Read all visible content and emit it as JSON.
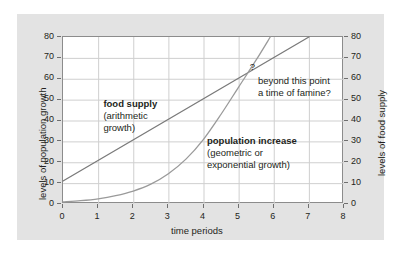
{
  "chart_data": {
    "type": "line",
    "title": "",
    "xlabel": "time periods",
    "ylabel": "levels of population growth",
    "y2label": "levels of food supply",
    "xlim": [
      0,
      8
    ],
    "ylim": [
      0,
      80
    ],
    "y2lim": [
      0,
      80
    ],
    "grid": true,
    "legend_position": "inline-annotations",
    "x_ticks": [
      "0",
      "1",
      "2",
      "3",
      "4",
      "5",
      "6",
      "7",
      "8"
    ],
    "y_ticks": [
      "0",
      "10",
      "20",
      "30",
      "40",
      "50",
      "60",
      "70",
      "80"
    ],
    "y2_ticks": [
      "0",
      "10",
      "20",
      "30",
      "40",
      "50",
      "60",
      "70",
      "80"
    ],
    "x": [
      0,
      0.5,
      1,
      1.5,
      2,
      2.5,
      3,
      3.5,
      4,
      4.5,
      5,
      5.5,
      6,
      6.5,
      7
    ],
    "series": [
      {
        "name": "food supply",
        "description": "arithmetic growth",
        "axis": "right",
        "color": "#7a7a7a",
        "x": [
          0,
          7
        ],
        "values": [
          11,
          80
        ]
      },
      {
        "name": "population increase",
        "description": "geometric or exponential growth",
        "axis": "left",
        "color": "#9a9a9a",
        "x": [
          0,
          0.5,
          1,
          1.5,
          2,
          2.5,
          3,
          3.5,
          4,
          4.5,
          5,
          5.5,
          5.9
        ],
        "values": [
          1,
          1.6,
          2.5,
          4,
          6.2,
          9.5,
          14.5,
          21.5,
          31,
          43,
          56,
          69,
          80
        ]
      }
    ],
    "annotations": [
      {
        "name": "food-supply-label",
        "header": "food supply",
        "lines": [
          "(arithmetic",
          "growth)"
        ],
        "x": 1.15,
        "y": 51
      },
      {
        "name": "population-increase-label",
        "header": "population increase",
        "lines": [
          "(geometric or",
          "exponential growth)"
        ],
        "x": 4.1,
        "y": 33
      },
      {
        "name": "famine-note",
        "header": "",
        "lines": [
          "beyond this point",
          "a time of famine?"
        ],
        "x": 5.55,
        "y": 62
      },
      {
        "name": "question-mark-marker",
        "header": "?",
        "lines": [],
        "x": 5.32,
        "y": 68
      }
    ],
    "crossing_point": {
      "x": 5.4,
      "y": 65
    }
  },
  "axes": {
    "left_title": "levels of population growth",
    "right_title": "levels of food supply",
    "x_title": "time periods"
  },
  "labels": {
    "food_supply_header": "food supply",
    "food_supply_line1": "(arithmetic",
    "food_supply_line2": "growth)",
    "population_header": "population increase",
    "population_line1": "(geometric or",
    "population_line2": "exponential growth)",
    "famine_line1": "beyond this point",
    "famine_line2": "a time of famine?",
    "question_mark": "?"
  },
  "colors": {
    "panel_background": "#e3e3e3",
    "plot_background": "#ffffff",
    "grid": "#cfcfcf",
    "frame": "#8c8c8c",
    "food_supply_line": "#7a7a7a",
    "population_line": "#9a9a9a",
    "text": "#231f20"
  }
}
